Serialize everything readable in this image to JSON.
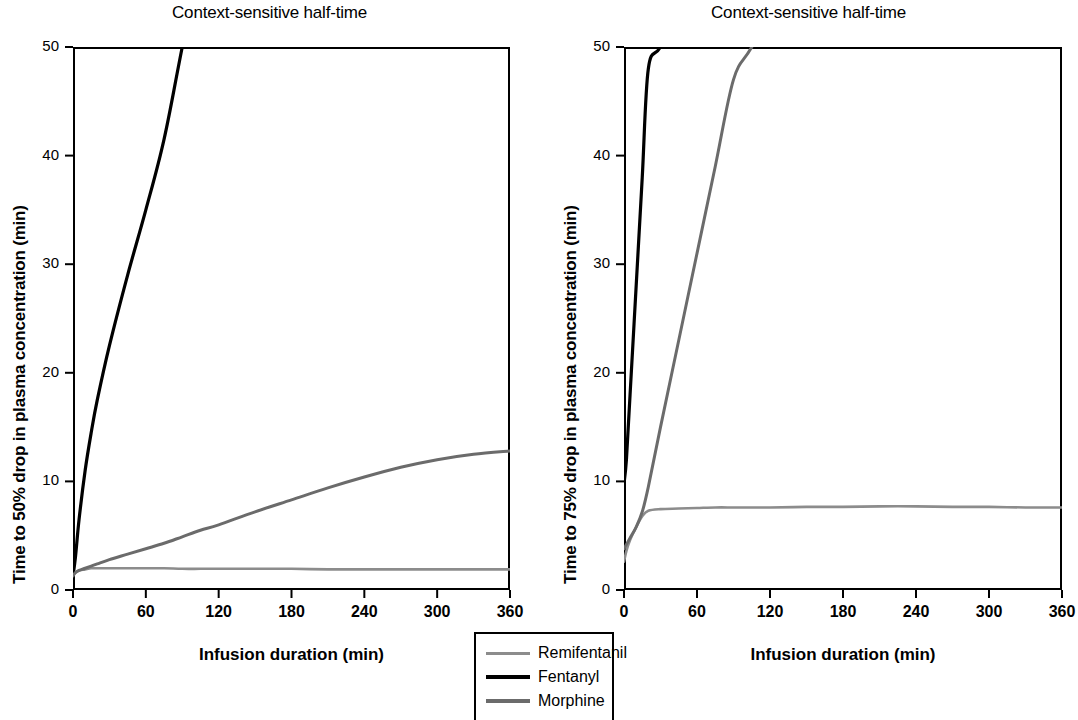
{
  "figure": {
    "background": "#ffffff",
    "axis_color": "#000000"
  },
  "legend": {
    "position": "bottom-center",
    "items": [
      {
        "label": "Remifentanil",
        "color": "#8c8c8c",
        "width": 3
      },
      {
        "label": "Fentanyl",
        "color": "#000000",
        "width": 4
      },
      {
        "label": "Morphine",
        "color": "#6b6b6b",
        "width": 4
      }
    ]
  },
  "panels": [
    {
      "id": "left",
      "title": "Context-sensitive half-time",
      "ylabel": "Time to 50% drop in plasma concentration (min)",
      "xlabel": "Infusion duration (min)",
      "yticks": [
        "0",
        "10",
        "20",
        "30",
        "40",
        "50"
      ],
      "xticks": [
        "0",
        "60",
        "120",
        "180",
        "240",
        "300",
        "360"
      ]
    },
    {
      "id": "right",
      "title": "Context-sensitive half-time",
      "ylabel": "Time to 75% drop in plasma concentration (min)",
      "xlabel": "Infusion duration (min)",
      "yticks": [
        "0",
        "10",
        "20",
        "30",
        "40",
        "50"
      ],
      "xticks": [
        "0",
        "60",
        "120",
        "180",
        "240",
        "300",
        "360"
      ]
    }
  ],
  "chart_data": [
    {
      "type": "line",
      "panel": "left",
      "title": "Context-sensitive half-time",
      "xlabel": "Infusion duration (min)",
      "ylabel": "Time to 50% drop in plasma concentration (min)",
      "xlim": [
        0,
        360
      ],
      "ylim": [
        0,
        50
      ],
      "xticks": [
        0,
        60,
        120,
        180,
        240,
        300,
        360
      ],
      "yticks": [
        0,
        10,
        20,
        30,
        40,
        50
      ],
      "grid": false,
      "legend_position": "below-between-panels",
      "x": [
        0,
        2,
        5,
        10,
        15,
        20,
        30,
        45,
        60,
        75,
        90,
        105,
        120,
        150,
        180,
        210,
        240,
        270,
        300,
        330,
        360
      ],
      "series": [
        {
          "name": "Remifentanil",
          "color": "#8c8c8c",
          "values": [
            1.3,
            1.6,
            1.8,
            1.9,
            2.0,
            2.0,
            2.0,
            2.0,
            2.0,
            2.0,
            1.95,
            1.95,
            1.95,
            1.95,
            1.95,
            1.9,
            1.9,
            1.9,
            1.9,
            1.9,
            1.9
          ]
        },
        {
          "name": "Fentanyl",
          "color": "#000000",
          "values": [
            1.3,
            3.0,
            6.5,
            11.0,
            14.5,
            17.5,
            22.5,
            29.0,
            35.0,
            41.5,
            50.0,
            null,
            null,
            null,
            null,
            null,
            null,
            null,
            null,
            null,
            null
          ],
          "note": "exits top of plot at about 87 min"
        },
        {
          "name": "Morphine",
          "color": "#6b6b6b",
          "values": [
            1.3,
            1.6,
            1.8,
            2.0,
            2.2,
            2.4,
            2.8,
            3.3,
            3.8,
            4.3,
            4.9,
            5.5,
            6.0,
            7.2,
            8.3,
            9.4,
            10.4,
            11.3,
            12.0,
            12.5,
            12.8
          ]
        }
      ]
    },
    {
      "type": "line",
      "panel": "right",
      "title": "Context-sensitive half-time",
      "xlabel": "Infusion duration (min)",
      "ylabel": "Time to 75% drop in plasma concentration (min)",
      "xlim": [
        0,
        360
      ],
      "ylim": [
        0,
        50
      ],
      "xticks": [
        0,
        60,
        120,
        180,
        240,
        300,
        360
      ],
      "yticks": [
        0,
        10,
        20,
        30,
        40,
        50
      ],
      "grid": false,
      "legend_position": "below-between-panels",
      "x": [
        0,
        2,
        5,
        10,
        15,
        20,
        30,
        45,
        60,
        75,
        90,
        105,
        120,
        150,
        180,
        210,
        240,
        270,
        300,
        330,
        360
      ],
      "series": [
        {
          "name": "Remifentanil",
          "color": "#8c8c8c",
          "values": [
            2.6,
            3.6,
            4.6,
            5.8,
            6.8,
            7.3,
            7.45,
            7.5,
            7.55,
            7.6,
            7.6,
            7.6,
            7.6,
            7.65,
            7.65,
            7.7,
            7.7,
            7.65,
            7.65,
            7.6,
            7.6
          ]
        },
        {
          "name": "Fentanyl",
          "color": "#000000",
          "values": [
            9.8,
            12.0,
            18.0,
            28.0,
            38.0,
            48.0,
            50.0,
            null,
            null,
            null,
            null,
            null,
            null,
            null,
            null,
            null,
            null,
            null,
            null,
            null,
            null
          ],
          "note": "near-vertical, exits top of plot at about 21 min"
        },
        {
          "name": "Morphine",
          "color": "#6b6b6b",
          "values": [
            3.8,
            4.2,
            4.8,
            5.8,
            7.2,
            9.5,
            15.0,
            23.0,
            31.0,
            39.0,
            47.0,
            50.0,
            null,
            null,
            null,
            null,
            null,
            null,
            null,
            null,
            null
          ],
          "note": "exits top of plot at about 104 min"
        }
      ]
    }
  ]
}
